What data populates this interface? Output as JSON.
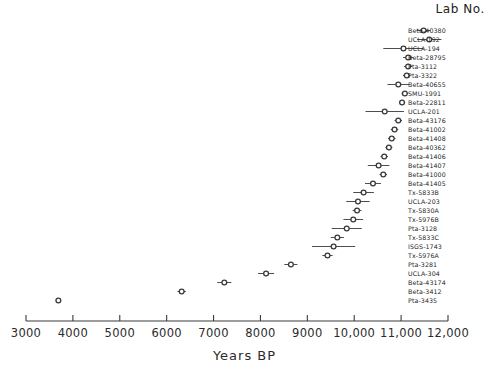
{
  "header": {
    "lab_column_title": "Lab No."
  },
  "axis": {
    "title": "Years BP",
    "ticks": [
      3000,
      4000,
      5000,
      6000,
      7000,
      8000,
      9000,
      10000,
      11000,
      12000
    ],
    "tick_labels": [
      "3000",
      "4000",
      "5000",
      "6000",
      "7000",
      "8000",
      "9000",
      "10,000",
      "11,000",
      "12,000"
    ],
    "xmin": 3000,
    "xmax": 12000,
    "axis_color": "#3a3a3a"
  },
  "chart_data": {
    "type": "scatter",
    "title": "",
    "xlabel": "Years BP",
    "ylabel": "Lab No.",
    "xlim": [
      3000,
      12000
    ],
    "grid": false,
    "legend": "none",
    "orientation": "horizontal-error-bars",
    "marker": "open-circle",
    "marker_color": "#3a3a3a",
    "categories": [
      "Beta-40380",
      "UCLA-192",
      "UCLA-194",
      "Beta-28795",
      "Pta-3112",
      "Pta-3322",
      "Beta-40655",
      "SMU-1991",
      "Beta-22811",
      "UCLA-201",
      "Beta-43176",
      "Beta-41002",
      "Beta-41408",
      "Beta-40362",
      "Beta-41406",
      "Beta-41407",
      "Beta-41000",
      "Beta-41405",
      "Tx-5833B",
      "UCLA-203",
      "Tx-5830A",
      "Tx-5976B",
      "Pta-3128",
      "Tx-5833C",
      "ISGS-1743",
      "Tx-5976A",
      "Pta-3281",
      "UCLA-304",
      "Beta-43174",
      "Beta-3412",
      "Pta-3435"
    ],
    "values": [
      11480,
      11600,
      11050,
      11150,
      11150,
      11120,
      10940,
      11080,
      11020,
      10650,
      10940,
      10860,
      10800,
      10740,
      10640,
      10520,
      10620,
      10400,
      10200,
      10080,
      10060,
      9980,
      9840,
      9640,
      9560,
      9430,
      8650,
      8120,
      7230,
      6320,
      3690
    ],
    "errors": [
      150,
      260,
      430,
      110,
      90,
      80,
      230,
      70,
      65,
      410,
      80,
      80,
      80,
      75,
      80,
      230,
      80,
      170,
      220,
      250,
      95,
      210,
      320,
      140,
      460,
      110,
      140,
      170,
      150,
      90,
      50
    ],
    "units": "radiocarbon years BP"
  }
}
